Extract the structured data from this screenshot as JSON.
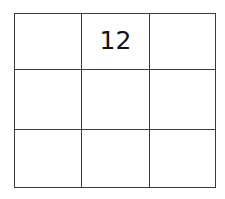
{
  "canvas": {
    "background_color": "#ffffff",
    "width": 225,
    "height": 199
  },
  "grid": {
    "rows": 3,
    "columns": 3,
    "line_color": "#3a3a3a",
    "text_color": "#111111",
    "cell_background": "#ffffff",
    "cells": [
      [
        {
          "value": "",
          "filled": false
        },
        {
          "value": "12",
          "filled": true
        },
        {
          "value": "",
          "filled": false
        }
      ],
      [
        {
          "value": "",
          "filled": false
        },
        {
          "value": "",
          "filled": false
        },
        {
          "value": "",
          "filled": false
        }
      ],
      [
        {
          "value": "",
          "filled": false
        },
        {
          "value": "",
          "filled": false
        },
        {
          "value": "",
          "filled": false
        }
      ]
    ]
  }
}
